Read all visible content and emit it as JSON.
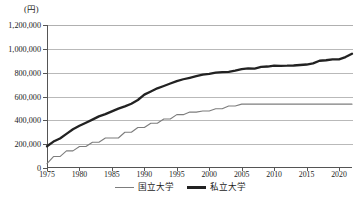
{
  "chart_data": {
    "type": "line",
    "title": "",
    "xlabel": "",
    "ylabel": "",
    "unit_label": "(円)",
    "ylim": [
      0,
      1200000
    ],
    "xlim": [
      1975,
      2022
    ],
    "grid": "horizontal",
    "legend_position": "bottom-center",
    "ytick_labels": [
      "1,200,000",
      "1,000,000",
      "800,000",
      "600,000",
      "400,000",
      "200,000",
      "0"
    ],
    "ytick_values": [
      1200000,
      1000000,
      800000,
      600000,
      400000,
      200000,
      0
    ],
    "xtick_labels": [
      "1975",
      "1980",
      "1985",
      "1990",
      "1995",
      "2000",
      "2005",
      "2010",
      "2015",
      "2020"
    ],
    "xtick_values": [
      1975,
      1980,
      1985,
      1990,
      1995,
      2000,
      2005,
      2010,
      2015,
      2020
    ],
    "x": [
      1975,
      1976,
      1977,
      1978,
      1979,
      1980,
      1981,
      1982,
      1983,
      1984,
      1985,
      1986,
      1987,
      1988,
      1989,
      1990,
      1991,
      1992,
      1993,
      1994,
      1995,
      1996,
      1997,
      1998,
      1999,
      2000,
      2001,
      2002,
      2003,
      2004,
      2005,
      2006,
      2007,
      2008,
      2009,
      2010,
      2011,
      2012,
      2013,
      2014,
      2015,
      2016,
      2017,
      2018,
      2019,
      2020,
      2021,
      2022
    ],
    "series": [
      {
        "name": "国立大学",
        "color": "#7d7d7d",
        "line_width": 1.1,
        "values": [
          36000,
          96000,
          96000,
          144000,
          144000,
          180000,
          180000,
          216000,
          216000,
          252000,
          252000,
          252000,
          300000,
          300000,
          339600,
          339600,
          375600,
          375600,
          411600,
          411600,
          447600,
          447600,
          469200,
          469200,
          478800,
          478800,
          496800,
          496800,
          520800,
          520800,
          535800,
          535800,
          535800,
          535800,
          535800,
          535800,
          535800,
          535800,
          535800,
          535800,
          535800,
          535800,
          535800,
          535800,
          535800,
          535800,
          535800,
          535800
        ]
      },
      {
        "name": "私立大学",
        "color": "#222222",
        "line_width": 2.3,
        "values": [
          182677,
          221844,
          248066,
          286568,
          325198,
          355156,
          380253,
          406261,
          433200,
          451722,
          475325,
          497826,
          517395,
          539591,
          570584,
          615486,
          641608,
          668460,
          688046,
          708847,
          728365,
          744733,
          757158,
          770024,
          783298,
          789659,
          799973,
          804367,
          807413,
          817952,
          830583,
          836297,
          834751,
          848178,
          851621,
          858265,
          857763,
          858265,
          860266,
          864384,
          868447,
          877735,
          900093,
          904146,
          911716,
          911716,
          930943,
          959205
        ]
      }
    ]
  },
  "axis": {
    "y_unit_caption": "(円)"
  },
  "legend": {
    "entries": [
      {
        "label": "国立大学",
        "style": "thin"
      },
      {
        "label": "私立大学",
        "style": "thick"
      }
    ]
  }
}
